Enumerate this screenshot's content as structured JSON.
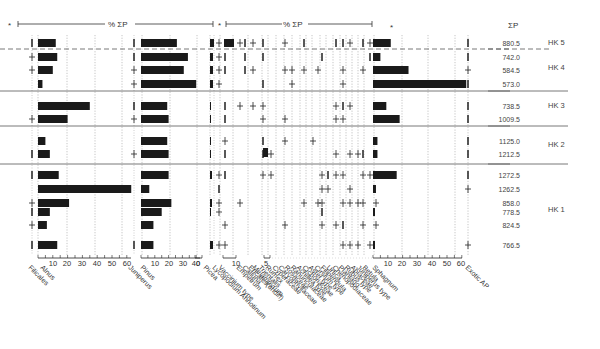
{
  "chart_data": {
    "type": "bar",
    "header": {
      "left_marker": "*",
      "unit_label": "% ΣP",
      "right_marker": "*",
      "sum_label": "ΣP"
    },
    "samples": [
      {
        "sum": "880.5",
        "zone": "HK 5"
      },
      {
        "sum": "742.0",
        "zone": "HK 4"
      },
      {
        "sum": "584.5",
        "zone": "HK 4"
      },
      {
        "sum": "573.0",
        "zone": "HK 4"
      },
      {
        "sum": "738.5",
        "zone": "HK 3"
      },
      {
        "sum": "1009.5",
        "zone": "HK 3"
      },
      {
        "sum": "1125.0",
        "zone": "HK 2"
      },
      {
        "sum": "1212.5",
        "zone": "HK 2"
      },
      {
        "sum": "1272.5",
        "zone": "HK 1"
      },
      {
        "sum": "1262.5",
        "zone": "HK 1"
      },
      {
        "sum": "858.0",
        "zone": "HK 1"
      },
      {
        "sum": "778.5",
        "zone": "HK 1"
      },
      {
        "sum": "824.5",
        "zone": "HK 1"
      },
      {
        "sum": "766.5",
        "zone": "HK 1"
      }
    ],
    "zones": [
      {
        "label": "HK 5"
      },
      {
        "label": "HK 4"
      },
      {
        "label": "HK 3"
      },
      {
        "label": "HK 2"
      },
      {
        "label": "HK 1"
      }
    ],
    "series": [
      {
        "name": "Filicales",
        "values": [
          "|",
          "+",
          "+",
          "",
          "",
          "+",
          "",
          "|",
          "|",
          "",
          "+",
          "|",
          "+",
          "|"
        ]
      },
      {
        "name": "Alnus",
        "values": [
          12,
          13,
          10,
          3,
          35,
          20,
          5,
          8,
          14,
          63,
          21,
          8,
          6,
          13
        ]
      },
      {
        "name": "Juniperus",
        "values": [
          "|",
          "|",
          "+",
          "+",
          "|",
          "+",
          "",
          "+",
          "",
          "",
          "",
          "",
          "",
          "|"
        ]
      },
      {
        "name": "Pinus",
        "values": [
          26,
          34,
          31,
          40,
          19,
          20,
          19,
          20,
          20,
          6,
          22,
          15,
          9,
          9
        ]
      },
      {
        "name": "Picea",
        "values": [
          "",
          "",
          "",
          "",
          "",
          "",
          "",
          "",
          "",
          "",
          "",
          "",
          "",
          ""
        ]
      },
      {
        "name": "Lycopodium Annotinum",
        "values": [
          2,
          2,
          3,
          2,
          1,
          1,
          1,
          1,
          2,
          1,
          2,
          1,
          2,
          2
        ]
      },
      {
        "name": "Vaccinium type",
        "values": [
          "+",
          "+",
          "+",
          "+",
          "",
          "",
          "+",
          "",
          "+",
          "+",
          "+",
          "+",
          "+",
          "+"
        ]
      },
      {
        "name": "Empetrum",
        "values": [
          5,
          1,
          2,
          0,
          1,
          0,
          1,
          2,
          2,
          1,
          0,
          0,
          1,
          1
        ]
      },
      {
        "name": "Calluna",
        "values": [
          6,
          1,
          2,
          0,
          0,
          0,
          0,
          0,
          0,
          0,
          0,
          0,
          0,
          0
        ]
      },
      {
        "name": "Ericales(undiff)",
        "values": [
          1,
          1,
          1,
          0,
          0,
          0,
          0,
          0,
          0,
          0,
          0,
          0,
          0,
          0
        ]
      },
      {
        "name": "Melampyrum",
        "values": [
          "+",
          "",
          "+",
          "",
          "+",
          "",
          "",
          "",
          "",
          "",
          "",
          "",
          "",
          ""
        ]
      },
      {
        "name": "Artemisia",
        "values": [
          1,
          1,
          1,
          1,
          3,
          0,
          1,
          3,
          1,
          0,
          0,
          0,
          0,
          0
        ]
      }
    ],
    "taxa_labels": [
      "Filicales",
      "Alnus",
      "Juniperus",
      "Pinus",
      "Picea",
      "Lycopodium Annotinum",
      "Vaccinium type",
      "Empetrum",
      "Calluna",
      "Ericales(undiff)",
      "Melampyrum",
      "Trientalis",
      "Rumex",
      "Cyperaceae",
      "Caryophyllaceae",
      "Rosaceae",
      "Ranunculaceae",
      "Achillea type",
      "Cichoriaceae",
      "Aster type",
      "Cirsium type",
      "Filipendula",
      "Urtica",
      "Chenopodiaceae",
      "Plantago",
      "Rubus type",
      "Apiaceae",
      "Juniperus type",
      "Betula",
      "Sphagnum",
      "Exotic AP"
    ],
    "sphagnum": [
      12,
      5,
      24,
      63,
      9,
      18,
      3,
      3,
      16,
      2,
      "+",
      1,
      "+",
      1
    ],
    "exotic_ap": [
      "|",
      "|",
      "+",
      "|",
      "|",
      "|",
      "|",
      "|",
      "|",
      "+",
      "",
      "",
      "",
      "+"
    ],
    "axes": [
      {
        "name": "Alnus/Filicales",
        "ticks": [
          "10",
          "20",
          "30",
          "40",
          "50",
          "60"
        ]
      },
      {
        "name": "Pinus/Juniperus",
        "ticks": [
          "10",
          "20",
          "30",
          "40"
        ]
      },
      {
        "name": "Picea-Lycopodium",
        "ticks": [
          "0",
          "10"
        ]
      },
      {
        "name": "Ericales",
        "ticks": [
          "5"
        ]
      },
      {
        "name": "Sphagnum",
        "ticks": [
          "10",
          "20",
          "30",
          "40",
          "50",
          "60"
        ]
      }
    ],
    "xlabel": "% ΣP",
    "ylabel": "",
    "legend_position": "none",
    "grid": "dotted vertical"
  }
}
